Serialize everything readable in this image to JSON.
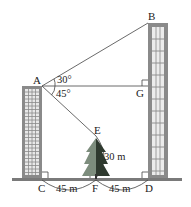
{
  "diagram": {
    "points": {
      "A": "A",
      "B": "B",
      "G": "G",
      "E": "E",
      "C": "C",
      "F": "F",
      "D": "D"
    },
    "angles": {
      "upper": "30°",
      "lower": "45°"
    },
    "measurements": {
      "tree_height": "30 m",
      "CF": "45 m",
      "FD": "45 m"
    },
    "colors": {
      "building": "#8a8a8a",
      "tree_light": "#6f7f6f",
      "tree_dark": "#2f3a2f",
      "ground": "#7a7a7a",
      "line": "#444444"
    }
  }
}
